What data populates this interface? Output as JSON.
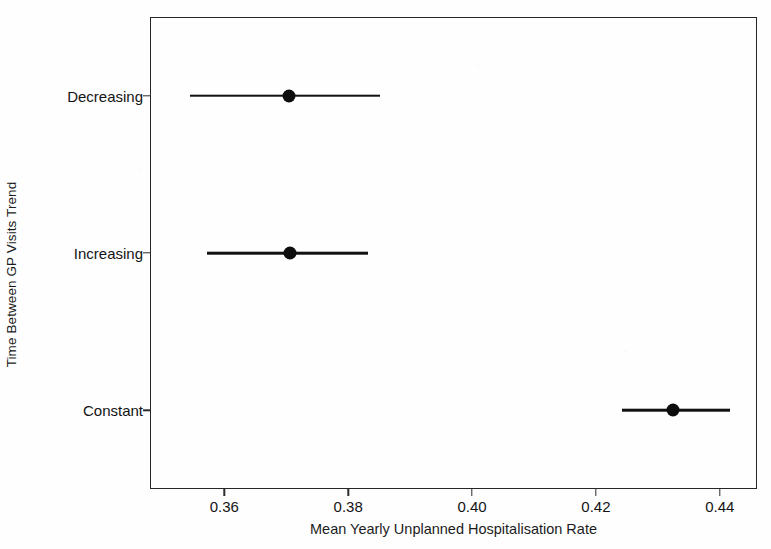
{
  "chart_data": {
    "type": "scatter",
    "title": "",
    "subtitle": "",
    "xlabel": "Mean Yearly Unplanned Hospitalisation Rate",
    "ylabel": "Time Between GP Visits Trend",
    "orientation": "horizontal",
    "categories": [
      "Decreasing",
      "Increasing",
      "Constant"
    ],
    "x_ticks": [
      0.36,
      0.38,
      0.4,
      0.42,
      0.44
    ],
    "x_tick_labels": [
      "0.36",
      "0.38",
      "0.40",
      "0.42",
      "0.44"
    ],
    "xlim": [
      0.348,
      0.446
    ],
    "grid": false,
    "legend": null,
    "marker": "filled-circle",
    "marker_color": "#0d0d0d",
    "line_color": "#111111",
    "points": [
      {
        "category": "Decreasing",
        "value": 0.3705,
        "ci_low": 0.3545,
        "ci_high": 0.3851
      },
      {
        "category": "Increasing",
        "value": 0.3706,
        "ci_low": 0.3572,
        "ci_high": 0.3832
      },
      {
        "category": "Constant",
        "value": 0.4325,
        "ci_low": 0.4242,
        "ci_high": 0.4417
      }
    ]
  },
  "axes": {
    "x_title": "Mean Yearly Unplanned Hospitalisation Rate",
    "y_title": "Time Between GP Visits Trend",
    "x_tick_labels": [
      "0.36",
      "0.38",
      "0.40",
      "0.42",
      "0.44"
    ],
    "y_tick_labels": [
      "Decreasing",
      "Increasing",
      "Constant"
    ]
  },
  "colors": {
    "marker": "#0d0d0d",
    "line": "#111111",
    "frame": "#262626",
    "background": "#fefefe",
    "text": "#141414"
  }
}
